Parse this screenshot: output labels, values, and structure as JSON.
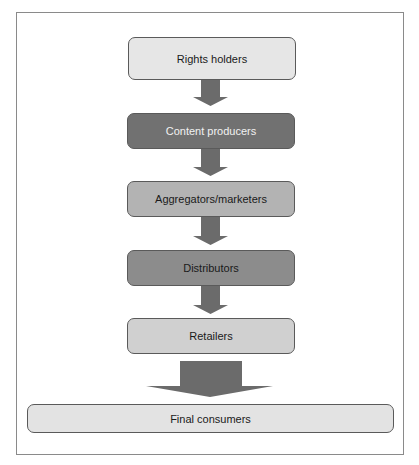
{
  "diagram": {
    "type": "flowchart",
    "direction": "top-to-bottom",
    "nodes": [
      {
        "id": "rights-holders",
        "label": "Rights holders",
        "fill": "#e6e6e6",
        "text_color": "#1a1a1a"
      },
      {
        "id": "content-producers",
        "label": "Content producers",
        "fill": "#717171",
        "text_color": "#f2f2f2"
      },
      {
        "id": "aggregators-marketers",
        "label": "Aggregators/marketers",
        "fill": "#b3b3b3",
        "text_color": "#1a1a1a"
      },
      {
        "id": "distributors",
        "label": "Distributors",
        "fill": "#8c8c8c",
        "text_color": "#1a1a1a"
      },
      {
        "id": "retailers",
        "label": "Retailers",
        "fill": "#d0d0d0",
        "text_color": "#1a1a1a"
      },
      {
        "id": "final-consumers",
        "label": "Final consumers",
        "fill": "#e3e3e3",
        "text_color": "#1a1a1a"
      }
    ],
    "edges": [
      {
        "from": "rights-holders",
        "to": "content-producers"
      },
      {
        "from": "content-producers",
        "to": "aggregators-marketers"
      },
      {
        "from": "aggregators-marketers",
        "to": "distributors"
      },
      {
        "from": "distributors",
        "to": "retailers"
      },
      {
        "from": "retailers",
        "to": "final-consumers"
      }
    ],
    "arrow_color": "#6b6b6b"
  }
}
